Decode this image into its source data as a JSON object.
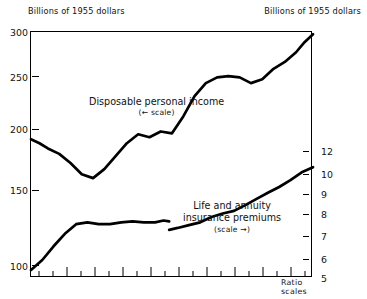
{
  "axis_captions": {
    "left": "Billions of 1955 dollars",
    "right": "Billions of 1955 dollars"
  },
  "notes": {
    "ratio_scales": "Ratio scales"
  },
  "labels": {
    "series1_name": "Disposable personal income",
    "series1_scale_note": "(← scale)",
    "series2_name_line1": "Life and annuity",
    "series2_name_line2": "insurance premiums",
    "series2_scale_note": "(scale →)"
  },
  "chart_data": {
    "type": "line",
    "title": "",
    "subtitle": "",
    "xlabel": "",
    "ylabel": "Billions of 1955 dollars",
    "grid": false,
    "legend_position": "inline-annotation",
    "scale": "log",
    "note": "Ratio scales",
    "left_axis": {
      "label": "Billions of 1955 dollars",
      "scale": "log",
      "ticks": [
        300,
        250,
        200,
        150,
        100
      ],
      "tick_labels": [
        "300",
        "250",
        "200",
        "150",
        "100"
      ],
      "range": [
        48,
        300
      ],
      "units": "billions of 1955 dollars"
    },
    "right_axis": {
      "label": "Billions of 1955 dollars",
      "scale": "log",
      "ticks": [
        12,
        10,
        9,
        8,
        7,
        6,
        5
      ],
      "tick_labels": [
        "12",
        "10",
        "9",
        "8",
        "7",
        "6",
        "5"
      ],
      "range": [
        5,
        30
      ],
      "units": "billions of 1955 dollars"
    },
    "x_axis": {
      "labels": [],
      "major_tick_count": 11,
      "minor_tick_count": 22,
      "tick_positions_pct": [
        3,
        8,
        13,
        18,
        23,
        28,
        33,
        38,
        43,
        48,
        53,
        58,
        63,
        68,
        73,
        78,
        83,
        88,
        93,
        98
      ]
    },
    "series": [
      {
        "name": "Disposable personal income",
        "axis": "left",
        "scale_note": "(← scale)",
        "x": [
          0,
          3,
          6,
          10,
          14,
          18,
          22,
          26,
          30,
          34,
          38,
          42,
          46,
          50,
          54,
          58,
          62,
          66,
          70,
          74,
          78,
          82,
          86,
          90,
          94,
          97,
          100
        ],
        "values": [
          135,
          131,
          126,
          121,
          113,
          104,
          101,
          108,
          119,
          131,
          140,
          137,
          143,
          141,
          160,
          186,
          205,
          214,
          216,
          214,
          205,
          211,
          228,
          240,
          258,
          278,
          295
        ]
      },
      {
        "name": "Life and annuity insurance premiums",
        "axis": "right",
        "scale_note": "(scale →)",
        "break_at_x": 49,
        "x": [
          0,
          4,
          8,
          12,
          16,
          20,
          24,
          28,
          32,
          36,
          40,
          44,
          47,
          49
        ],
        "values": [
          5.3,
          5.7,
          6.3,
          6.9,
          7.4,
          7.5,
          7.4,
          7.4,
          7.5,
          7.55,
          7.5,
          7.5,
          7.6,
          7.55
        ],
        "x2": [
          49,
          52,
          56,
          60,
          64,
          68,
          72,
          76,
          80,
          84,
          88,
          92,
          96,
          100
        ],
        "values2": [
          7.1,
          7.2,
          7.35,
          7.5,
          7.8,
          8.0,
          8.15,
          8.5,
          8.9,
          9.3,
          9.7,
          10.2,
          10.8,
          11.2
        ]
      }
    ]
  }
}
